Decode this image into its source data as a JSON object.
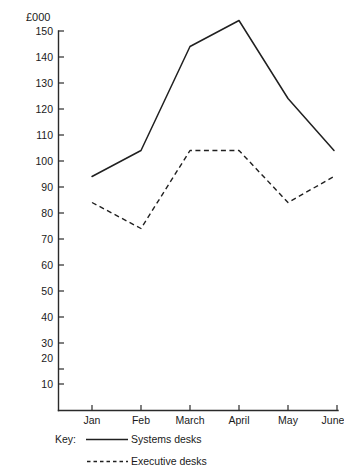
{
  "chart_data": {
    "type": "line",
    "title": "",
    "subtitle": "",
    "xlabel": "",
    "ylabel": "£000",
    "categories": [
      "Jan",
      "Feb",
      "March",
      "April",
      "May",
      "June"
    ],
    "series": [
      {
        "name": "Systems desks",
        "style": "solid",
        "values": [
          90,
          100,
          140,
          150,
          120,
          100
        ]
      },
      {
        "name": "Executive desks",
        "style": "dashed",
        "values": [
          80,
          70,
          100,
          100,
          80,
          90
        ]
      }
    ],
    "ylim": [
      0,
      150
    ],
    "y_ticks": [
      150,
      140,
      130,
      120,
      110,
      100,
      90,
      80,
      70,
      60,
      50,
      40,
      30,
      20,
      10
    ],
    "y_tick_labels": [
      "150",
      "140",
      "130",
      "120",
      "110",
      "100",
      "90",
      "80",
      "70",
      "60",
      "50",
      "40",
      "30",
      "20",
      "10"
    ],
    "grid": false,
    "legend_position": "below-axis"
  },
  "axis": {
    "unit_label": "£000"
  },
  "legend": {
    "key_label": "Key:",
    "entries": [
      {
        "label": "Systems desks",
        "style": "solid"
      },
      {
        "label": "Executive desks",
        "style": "dashed"
      }
    ]
  }
}
